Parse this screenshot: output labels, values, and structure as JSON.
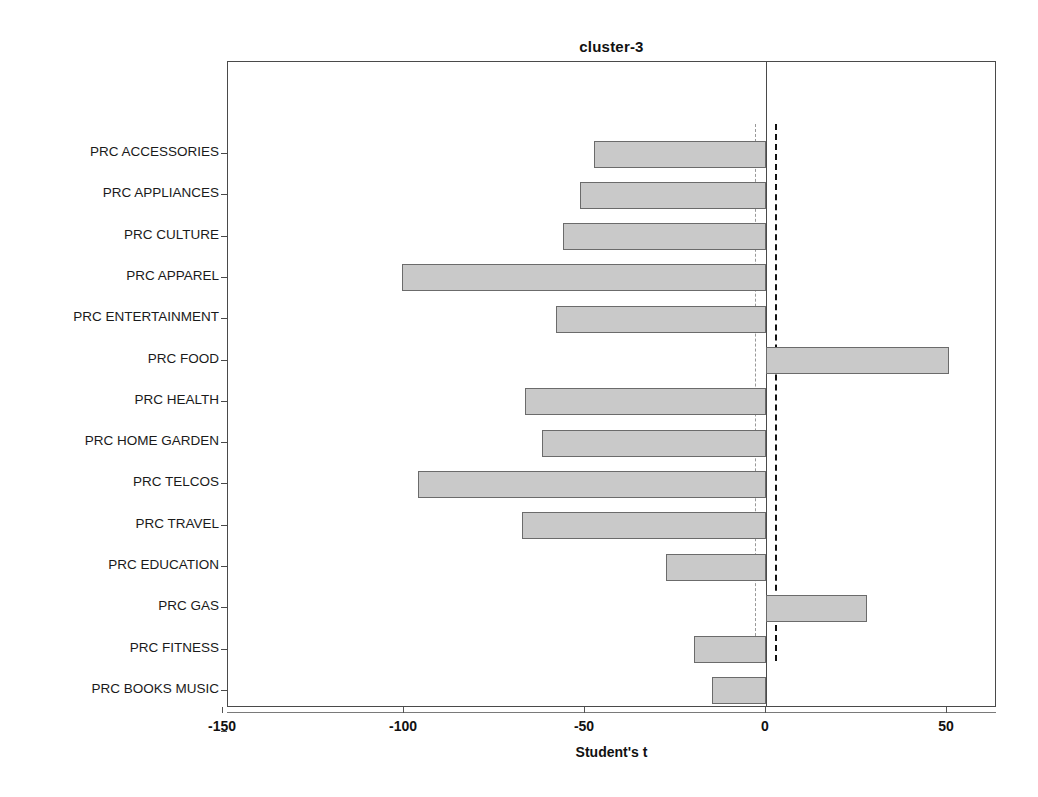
{
  "chart_data": {
    "type": "bar",
    "orientation": "horizontal",
    "title": "cluster-3",
    "xlabel": "Student's t",
    "ylabel": "",
    "xlim": [
      -160,
      64
    ],
    "xticks": [
      -150,
      -100,
      -50,
      0,
      50
    ],
    "xtick_labels": [
      "-150",
      "-100",
      "-50",
      "0",
      "50"
    ],
    "grid": false,
    "legend": null,
    "zero_line": 0,
    "reference_lines": [
      {
        "value": -3.0,
        "style": "dashed",
        "color": "#999999"
      },
      {
        "value": 2.5,
        "style": "dashed",
        "color": "#111111"
      }
    ],
    "bar_style": {
      "fill": "#c9c9c9",
      "edge": "#6b6b6b"
    },
    "categories": [
      "PRC ACCESSORIES",
      "PRC APPLIANCES",
      "PRC CULTURE",
      "PRC APPAREL",
      "PRC ENTERTAINMENT",
      "PRC FOOD",
      "PRC HEALTH",
      "PRC HOME GARDEN",
      "PRC TELCOS",
      "PRC TRAVEL",
      "PRC EDUCATION",
      "PRC GAS",
      "PRC FITNESS",
      "PRC BOOKS MUSIC"
    ],
    "values": [
      -47.5,
      -51.5,
      -56.0,
      -100.5,
      -58.0,
      50.5,
      -66.5,
      -62.0,
      -96.0,
      -67.5,
      -27.5,
      28.0,
      -20.0,
      -15.0
    ]
  }
}
